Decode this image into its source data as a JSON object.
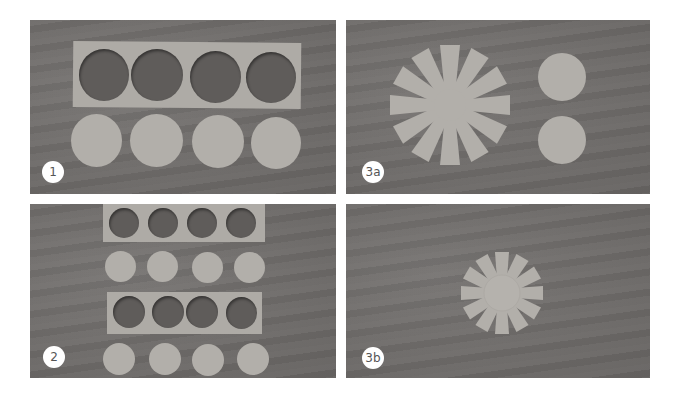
{
  "panels": [
    {
      "id": "1",
      "label": "1",
      "description": "Paper strip with 4 circular holes above 4 cut-out paper discs"
    },
    {
      "id": "3a",
      "label": "3a",
      "description": "12-ray paper star beside 2 paper discs"
    },
    {
      "id": "2",
      "label": "2",
      "description": "Two strips with 4 holes each, alternating with two rows of 4 smaller discs"
    },
    {
      "id": "3b",
      "label": "3b",
      "description": "12-ray star with a disc glued at its center"
    }
  ],
  "colors": {
    "wood": "#6f6c6a",
    "paper": "#b2afaa",
    "badge_bg": "#ffffff",
    "badge_text": "#555555"
  }
}
